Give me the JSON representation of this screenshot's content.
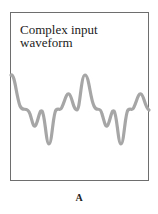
{
  "figure": {
    "title_line1": "Complex input",
    "title_line2": "waveform",
    "panel_label": "A",
    "frame_color": "#6e6e6e",
    "wave_color": "#a6a6a6"
  }
}
